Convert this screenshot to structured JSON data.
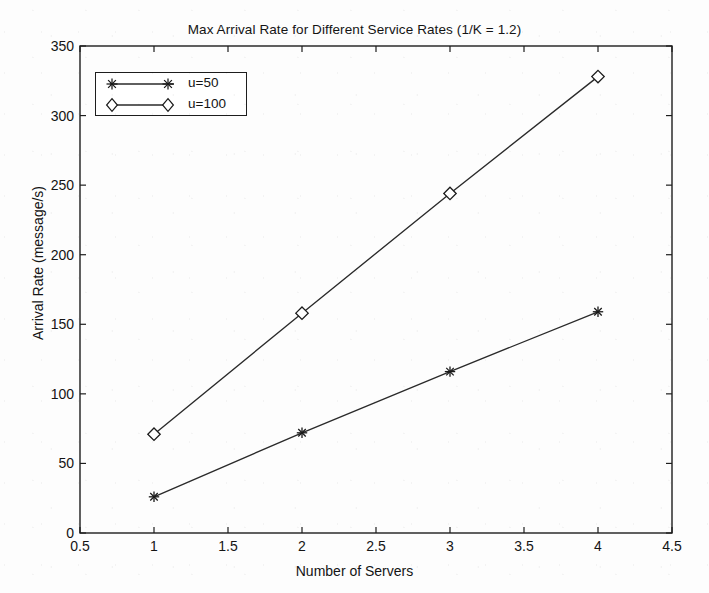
{
  "chart_data": {
    "type": "line",
    "title": "Max Arrival Rate for Different Service Rates (1/K = 1.2)",
    "xlabel": "Number of Servers",
    "ylabel": "Arrival Rate (message/s)",
    "xlim": [
      0.5,
      4.5
    ],
    "ylim": [
      0,
      350
    ],
    "xticks": [
      0.5,
      1,
      1.5,
      2,
      2.5,
      3,
      3.5,
      4,
      4.5
    ],
    "xtick_labels": [
      "0.5",
      "1",
      "1.5",
      "2",
      "2.5",
      "3",
      "3.5",
      "4",
      "4.5"
    ],
    "yticks": [
      0,
      50,
      100,
      150,
      200,
      250,
      300,
      350
    ],
    "ytick_labels": [
      "0",
      "50",
      "100",
      "150",
      "200",
      "250",
      "300",
      "350"
    ],
    "grid": false,
    "legend_position": "upper left",
    "x": [
      1,
      2,
      3,
      4
    ],
    "series": [
      {
        "name": "u=50",
        "marker": "asterisk",
        "color": "#1a1a1a",
        "values": [
          26,
          72,
          116,
          159
        ]
      },
      {
        "name": "u=100",
        "marker": "diamond",
        "color": "#1a1a1a",
        "values": [
          71,
          158,
          244,
          328
        ]
      }
    ]
  },
  "legend": {
    "entries": [
      {
        "label": "u=50",
        "marker": "asterisk"
      },
      {
        "label": "u=100",
        "marker": "diamond"
      }
    ]
  },
  "colors": {
    "axis": "#1d1d1d",
    "line": "#2a2a2a",
    "background": "#fdfdfd",
    "text": "#141414"
  }
}
